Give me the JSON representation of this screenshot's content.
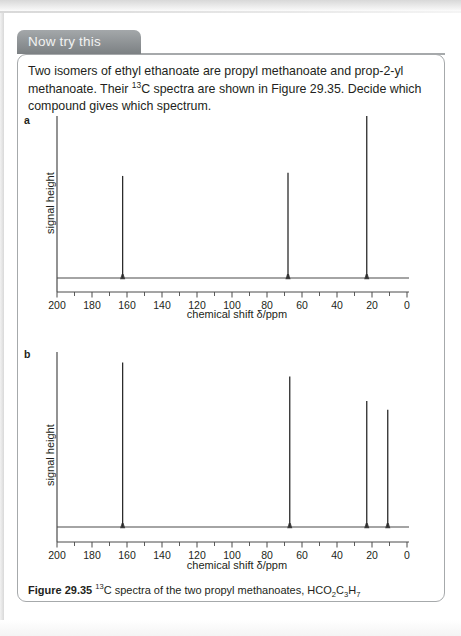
{
  "panel": {
    "tab_label": "Now try this",
    "intro_line1_a": "Two isomers of ethyl ethanoate are propyl methanoate and prop-2-yl methanoate. Their",
    "intro_sup": "13",
    "intro_line2_b": "C spectra are shown in Figure 29.35. Decide which compound gives which spectrum."
  },
  "caption": {
    "figure_number": "Figure 29.35",
    "sup": "13",
    "text_a": "C spectra of the two propyl methanoates, HCO",
    "sub1": "2",
    "text_b": "C",
    "sub2": "3",
    "text_c": "H",
    "sub3": "7"
  },
  "axis": {
    "xlabel": "chemical shift δ/ppm",
    "ylabel": "signal height",
    "ticks": [
      "200",
      "180",
      "160",
      "140",
      "120",
      "100",
      "80",
      "60",
      "40",
      "20",
      "0"
    ],
    "xmin": 0,
    "xmax": 200,
    "reversed": true
  },
  "colors": {
    "tab_background": "#8a8f92",
    "box_border": "#a6a9ab",
    "text": "#231f20",
    "axis_line": "#4a4a4a",
    "peak_line": "#2b2b2b",
    "page_background": "#ffffff"
  },
  "chart_data": [
    {
      "type": "line",
      "id": "a",
      "label": "a",
      "title": "",
      "xlabel": "chemical shift δ/ppm",
      "ylabel": "signal height",
      "xlim": [
        200,
        0
      ],
      "ylim": [
        0,
        100
      ],
      "grid": false,
      "xticks": [
        200,
        180,
        160,
        140,
        120,
        100,
        80,
        60,
        40,
        20,
        0
      ],
      "peaks": [
        {
          "shift_ppm": 162.5,
          "height": 63
        },
        {
          "shift_ppm": 68.0,
          "height": 65
        },
        {
          "shift_ppm": 23.0,
          "height": 100
        }
      ]
    },
    {
      "type": "line",
      "id": "b",
      "label": "b",
      "title": "",
      "xlabel": "chemical shift δ/ppm",
      "ylabel": "signal height",
      "xlim": [
        200,
        0
      ],
      "ylim": [
        0,
        100
      ],
      "grid": false,
      "xticks": [
        200,
        180,
        160,
        140,
        120,
        100,
        80,
        60,
        40,
        20,
        0
      ],
      "peaks": [
        {
          "shift_ppm": 162.5,
          "height": 94
        },
        {
          "shift_ppm": 67.0,
          "height": 86
        },
        {
          "shift_ppm": 23.0,
          "height": 72
        },
        {
          "shift_ppm": 11.0,
          "height": 67
        }
      ]
    }
  ]
}
